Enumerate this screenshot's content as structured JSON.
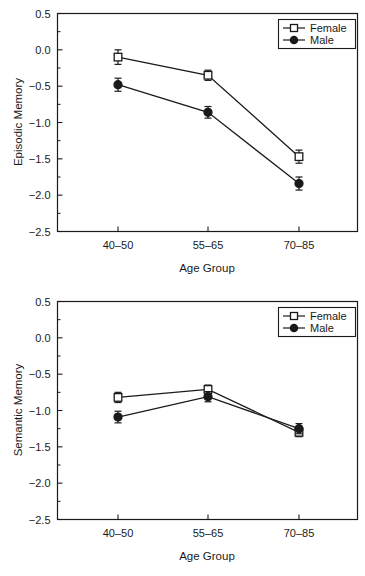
{
  "figure": {
    "panels": [
      "episodic",
      "semantic"
    ]
  },
  "chart_data": [
    {
      "type": "line",
      "id": "episodic",
      "title": "",
      "xlabel": "Age Group",
      "ylabel": "Episodic Memory",
      "categories": [
        "40–50",
        "55–65",
        "70–85"
      ],
      "ylim": [
        -2.5,
        0.5
      ],
      "yticks": [
        0.5,
        0.0,
        -0.5,
        -1.0,
        -1.5,
        -2.0,
        -2.5
      ],
      "yticklabels": [
        "0.5",
        "0.0",
        "−0.5",
        "−1.0",
        "−1.5",
        "−2.0",
        "−2.5"
      ],
      "minor_ticks": true,
      "grid": false,
      "legend_position": "top-right",
      "series": [
        {
          "name": "Female",
          "marker": "open-square",
          "values": [
            -0.1,
            -0.35,
            -1.47
          ],
          "errors": [
            0.1,
            0.07,
            0.09
          ]
        },
        {
          "name": "Male",
          "marker": "filled-circle",
          "values": [
            -0.48,
            -0.86,
            -1.84
          ],
          "errors": [
            0.09,
            0.08,
            0.09
          ]
        }
      ]
    },
    {
      "type": "line",
      "id": "semantic",
      "title": "",
      "xlabel": "Age Group",
      "ylabel": "Semantic Memory",
      "categories": [
        "40–50",
        "55–65",
        "70–85"
      ],
      "ylim": [
        -2.5,
        0.5
      ],
      "yticks": [
        0.5,
        0.0,
        -0.5,
        -1.0,
        -1.5,
        -2.0,
        -2.5
      ],
      "yticklabels": [
        "0.5",
        "0.0",
        "−0.5",
        "−1.0",
        "−1.5",
        "−2.0",
        "−2.5"
      ],
      "minor_ticks": true,
      "grid": false,
      "legend_position": "top-right",
      "series": [
        {
          "name": "Female",
          "marker": "open-square",
          "values": [
            -0.82,
            -0.71,
            -1.3
          ],
          "errors": [
            0.07,
            0.06,
            0.06
          ]
        },
        {
          "name": "Male",
          "marker": "filled-circle",
          "values": [
            -1.09,
            -0.81,
            -1.25
          ],
          "errors": [
            0.08,
            0.07,
            0.07
          ]
        }
      ]
    }
  ],
  "legend": {
    "female_label": "Female",
    "male_label": "Male"
  },
  "colors": {
    "ink": "#1a1a1a",
    "background": "#ffffff"
  }
}
